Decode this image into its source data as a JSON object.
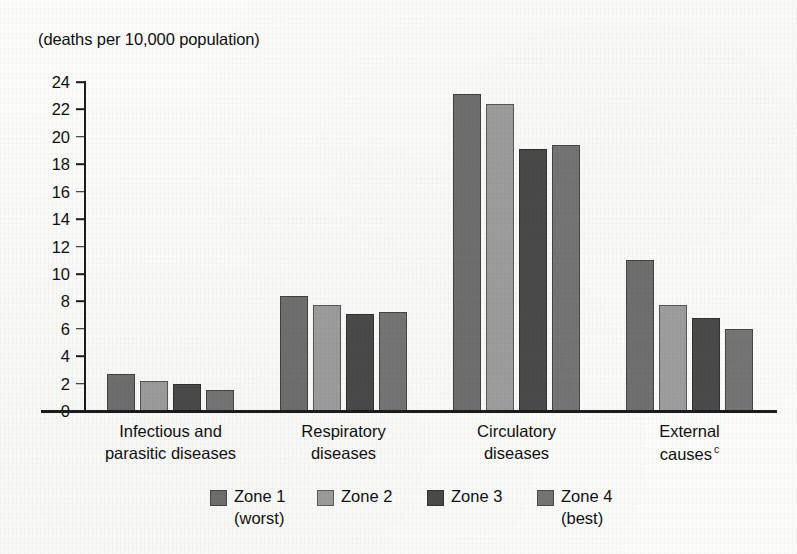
{
  "chart_data": {
    "type": "bar",
    "title": "(deaths per 10,000 population)",
    "xlabel": "",
    "ylabel": "(deaths per 10,000 population)",
    "ylim": [
      0,
      24
    ],
    "ytick_step": 2,
    "ytick_labels": [
      "24",
      "22",
      "20",
      "18",
      "16",
      "14",
      "12",
      "10",
      "8",
      "6",
      "4",
      "2",
      "0"
    ],
    "grid": false,
    "legend_position": "bottom",
    "categories": [
      "Infectious and parasitic diseases",
      "Respiratory diseases",
      "Circulatory diseases",
      "External causes"
    ],
    "category_lines": [
      [
        "Infectious and",
        "parasitic diseases"
      ],
      [
        "Respiratory",
        "diseases"
      ],
      [
        "Circulatory",
        "diseases"
      ],
      [
        "External",
        "causes"
      ]
    ],
    "category_footnote_marks": [
      "",
      "",
      "",
      "c"
    ],
    "series": [
      {
        "name": "Zone 1",
        "sublabel": "(worst)",
        "color": "#6f6f6f",
        "values": [
          2.7,
          8.4,
          23.1,
          11.0
        ]
      },
      {
        "name": "Zone 2",
        "sublabel": "",
        "color": "#9d9d9d",
        "values": [
          2.2,
          7.7,
          22.4,
          7.7
        ]
      },
      {
        "name": "Zone 3",
        "sublabel": "",
        "color": "#4a4a4a",
        "values": [
          1.95,
          7.1,
          19.1,
          6.8
        ]
      },
      {
        "name": "Zone 4",
        "sublabel": "(best)",
        "color": "#757575",
        "values": [
          1.5,
          7.2,
          19.4,
          6.0
        ]
      }
    ]
  },
  "legend": {
    "items": [
      {
        "label": "Zone 1",
        "sublabel": "(worst)"
      },
      {
        "label": "Zone 2",
        "sublabel": ""
      },
      {
        "label": "Zone 3",
        "sublabel": ""
      },
      {
        "label": "Zone 4",
        "sublabel": "(best)"
      }
    ]
  },
  "colors": {
    "axis": "#1c1c1c",
    "background": "#fbfbfa",
    "text": "#101010"
  }
}
